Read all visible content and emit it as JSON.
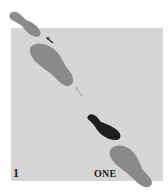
{
  "diagram": {
    "step_number": "1",
    "count_label": "ONE",
    "colors": {
      "panel": "#d6d6d6",
      "previous_foot": "#8a8a8a",
      "active_foot": "#1e1e1e",
      "arrow": "#3a3a3a",
      "arrow_faint": "#a8a8a8",
      "label": "#1a1a1a"
    },
    "footprints": [
      {
        "id": "lead-partner-toe",
        "shape": "toe-heel-narrow",
        "state": "previous"
      },
      {
        "id": "lead-partner-foot",
        "shape": "full-foot",
        "state": "previous"
      },
      {
        "id": "follow-partner-toe",
        "shape": "toe-heel-narrow",
        "state": "active"
      },
      {
        "id": "follow-partner-foot",
        "shape": "full-foot",
        "state": "previous"
      }
    ],
    "arrows": [
      {
        "id": "arrow-upper",
        "direction": "up-left"
      },
      {
        "id": "arrow-middle",
        "direction": "up-left",
        "style": "faint"
      }
    ]
  }
}
